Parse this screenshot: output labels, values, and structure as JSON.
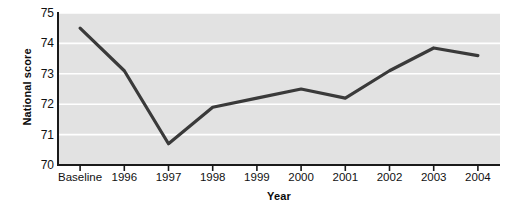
{
  "chart_data": {
    "type": "line",
    "title": "",
    "xlabel": "Year",
    "ylabel": "National score",
    "categories": [
      "Baseline",
      "1996",
      "1997",
      "1998",
      "1999",
      "2000",
      "2001",
      "2002",
      "2003",
      "2004"
    ],
    "values": [
      74.5,
      73.1,
      70.7,
      71.9,
      72.2,
      72.5,
      72.2,
      73.1,
      73.85,
      73.6
    ],
    "series": [
      {
        "name": "National score",
        "values": [
          74.5,
          73.1,
          70.7,
          71.9,
          72.2,
          72.5,
          72.2,
          73.1,
          73.85,
          73.6
        ]
      }
    ],
    "ylim": [
      70,
      75
    ],
    "yticks": [
      70,
      71,
      72,
      73,
      74,
      75
    ],
    "ytick_labels": [
      "70",
      "71",
      "72",
      "73",
      "74",
      "75"
    ],
    "grid": true,
    "grid_axis": "y",
    "legend": false,
    "legend_position": "none",
    "colors": {
      "line": "#3a3a3a",
      "plot_background": "#e2e2e2",
      "gridline": "#ffffff",
      "axis": "#1a1a1a",
      "text": "#111111",
      "page_background": "#ffffff"
    }
  }
}
